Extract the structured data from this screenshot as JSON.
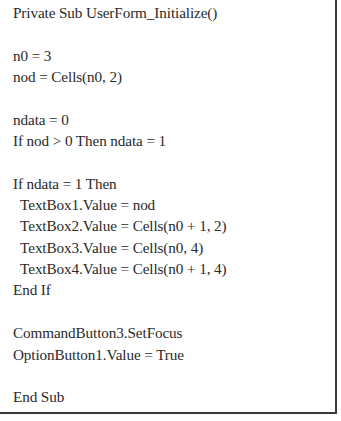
{
  "code": {
    "language": "VBA",
    "lines": [
      "Private Sub UserForm_Initialize()",
      "",
      "n0 = 3",
      "nod = Cells(n0, 2)",
      "",
      "ndata = 0",
      "If nod > 0 Then ndata = 1",
      "",
      "If ndata = 1 Then",
      "  TextBox1.Value = nod",
      "  TextBox2.Value = Cells(n0 + 1, 2)",
      "  TextBox3.Value = Cells(n0, 4)",
      "  TextBox4.Value = Cells(n0 + 1, 4)",
      "End If",
      "",
      "CommandButton3.SetFocus",
      "OptionButton1.Value = True",
      "",
      "End Sub"
    ]
  }
}
